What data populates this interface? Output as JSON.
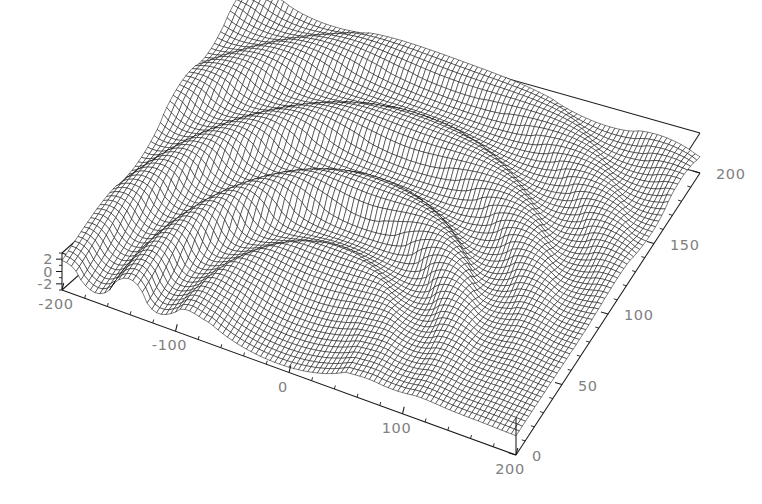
{
  "figure": {
    "kind": "3d-surface-wireframe-plot",
    "background_color": "#ffffff",
    "mesh_color": "#000000",
    "axis_color": "#1a1a1a",
    "tick_label_color": "#808080",
    "width": 762,
    "height": 504
  },
  "chart_data": {
    "type": "line",
    "render": "3d-mesh-surface",
    "title": "",
    "subtitle": "",
    "xlabel": "",
    "ylabel": "",
    "zlabel": "",
    "grid": false,
    "legend": "none",
    "axes": {
      "x": {
        "name": "x-axis-front-bottom",
        "min": -200,
        "max": 200,
        "major_ticks": [
          -200,
          -100,
          0,
          100,
          200
        ],
        "major_tick_labels": [
          "-200",
          "-100",
          "0",
          "100",
          "200"
        ],
        "minor_tick_step": 20
      },
      "y": {
        "name": "y-axis-right-bottom",
        "min": 0,
        "max": 200,
        "major_ticks": [
          0,
          50,
          100,
          150,
          200
        ],
        "major_tick_labels": [
          "0",
          "50",
          "100",
          "150",
          "200"
        ],
        "minor_tick_step": 10
      },
      "z": {
        "name": "z-axis-left-vertical",
        "min": -3,
        "max": 3,
        "major_ticks": [
          -2,
          0,
          2
        ],
        "major_tick_labels": [
          "-2",
          "0",
          "2"
        ],
        "minor_tick_step": 1
      }
    },
    "surface": {
      "description": "Oscillatory rippled surface over x in [-200,200], y in [0,200]; high-frequency corrugations forming an arch with a flat central void",
      "x_samples": 96,
      "y_samples": 58,
      "z_range": [
        -3,
        3
      ]
    },
    "view": {
      "projection": "oblique-parallel",
      "box_corners_px": {
        "front_bottom": [
          516,
          455
        ],
        "left_bottom": [
          62,
          290
        ],
        "right_bottom": [
          700,
          173
        ],
        "back_bottom": [
          318,
          62
        ],
        "front_top": [
          516,
          418
        ],
        "left_top": [
          62,
          253
        ],
        "right_top": [
          700,
          133
        ],
        "back_top": [
          318,
          25
        ]
      }
    }
  },
  "labels": {
    "x_ticks": [
      "-200",
      "-100",
      "0",
      "100",
      "200"
    ],
    "y_ticks": [
      "0",
      "50",
      "100",
      "150",
      "200"
    ],
    "z_ticks": [
      "2",
      "0",
      "-2"
    ]
  }
}
